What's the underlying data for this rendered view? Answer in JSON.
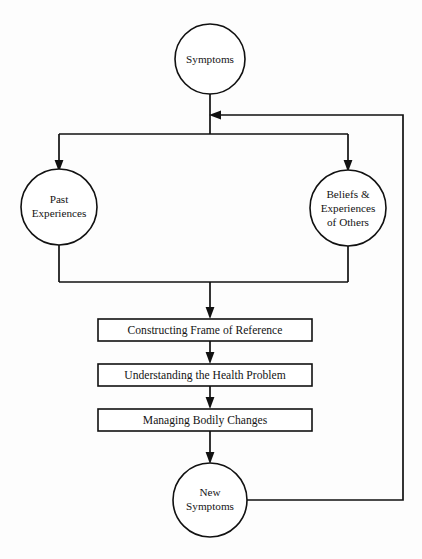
{
  "diagram": {
    "background_color": "#fdfdfd",
    "line_color": "#111111",
    "shape_fill": "#ffffff",
    "nodes": {
      "symptoms": {
        "label": "Symptoms",
        "shape": "circle"
      },
      "past_experiences": {
        "line1": "Past",
        "line2": "Experiences",
        "shape": "circle"
      },
      "beliefs_others": {
        "line1": "Beliefs &",
        "line2": "Experiences",
        "line3": "of Others",
        "shape": "circle"
      },
      "constructing_frame": {
        "label": "Constructing Frame of Reference",
        "shape": "rectangle"
      },
      "understanding_problem": {
        "label": "Understanding the Health Problem",
        "shape": "rectangle"
      },
      "managing_changes": {
        "label": "Managing Bodily Changes",
        "shape": "rectangle"
      },
      "new_symptoms": {
        "line1": "New",
        "line2": "Symptoms",
        "shape": "circle"
      }
    },
    "edges": [
      {
        "name": "symptoms-to-split",
        "from": "symptoms",
        "to": "split-bar",
        "arrow": false
      },
      {
        "name": "split-to-past-experiences",
        "from": "split-bar",
        "to": "past_experiences",
        "arrow": true
      },
      {
        "name": "split-to-beliefs-others",
        "from": "split-bar",
        "to": "beliefs_others",
        "arrow": true
      },
      {
        "name": "past-experiences-to-merge",
        "from": "past_experiences",
        "to": "merge-bar",
        "arrow": false
      },
      {
        "name": "beliefs-others-to-merge",
        "from": "beliefs_others",
        "to": "merge-bar",
        "arrow": false
      },
      {
        "name": "merge-to-constructing-frame",
        "from": "merge-bar",
        "to": "constructing_frame",
        "arrow": true
      },
      {
        "name": "constructing-frame-to-understanding",
        "from": "constructing_frame",
        "to": "understanding_problem",
        "arrow": true
      },
      {
        "name": "understanding-to-managing",
        "from": "understanding_problem",
        "to": "managing_changes",
        "arrow": true
      },
      {
        "name": "managing-to-new-symptoms",
        "from": "managing_changes",
        "to": "new_symptoms",
        "arrow": true
      },
      {
        "name": "new-symptoms-feedback-to-symptoms",
        "from": "new_symptoms",
        "to": "symptoms",
        "arrow": true
      }
    ]
  }
}
